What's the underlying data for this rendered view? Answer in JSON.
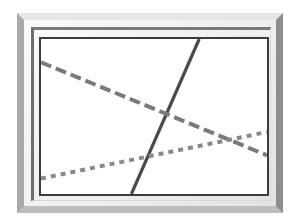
{
  "chart_data": {
    "type": "line",
    "title": "",
    "xlabel": "",
    "ylabel": "",
    "grid": false,
    "legend": null,
    "xlim": [
      0,
      100
    ],
    "ylim": [
      0,
      100
    ],
    "series": [
      {
        "name": "solid",
        "style": "solid",
        "color": "#4a4a4a",
        "x": [
          40,
          70
        ],
        "y": [
          0,
          100
        ]
      },
      {
        "name": "dashed",
        "style": "dashed",
        "color": "#7a7a7a",
        "x": [
          0,
          100
        ],
        "y": [
          85,
          25
        ]
      },
      {
        "name": "dotted",
        "style": "dotted",
        "color": "#8a8a8a",
        "x": [
          0,
          100
        ],
        "y": [
          10,
          40
        ]
      }
    ]
  },
  "frame": {
    "style": "beveled-picture-frame",
    "outer_color": "#a9a9a9",
    "matte_color": "#f2f2f2",
    "plot_border_color": "#3c3c3c"
  }
}
